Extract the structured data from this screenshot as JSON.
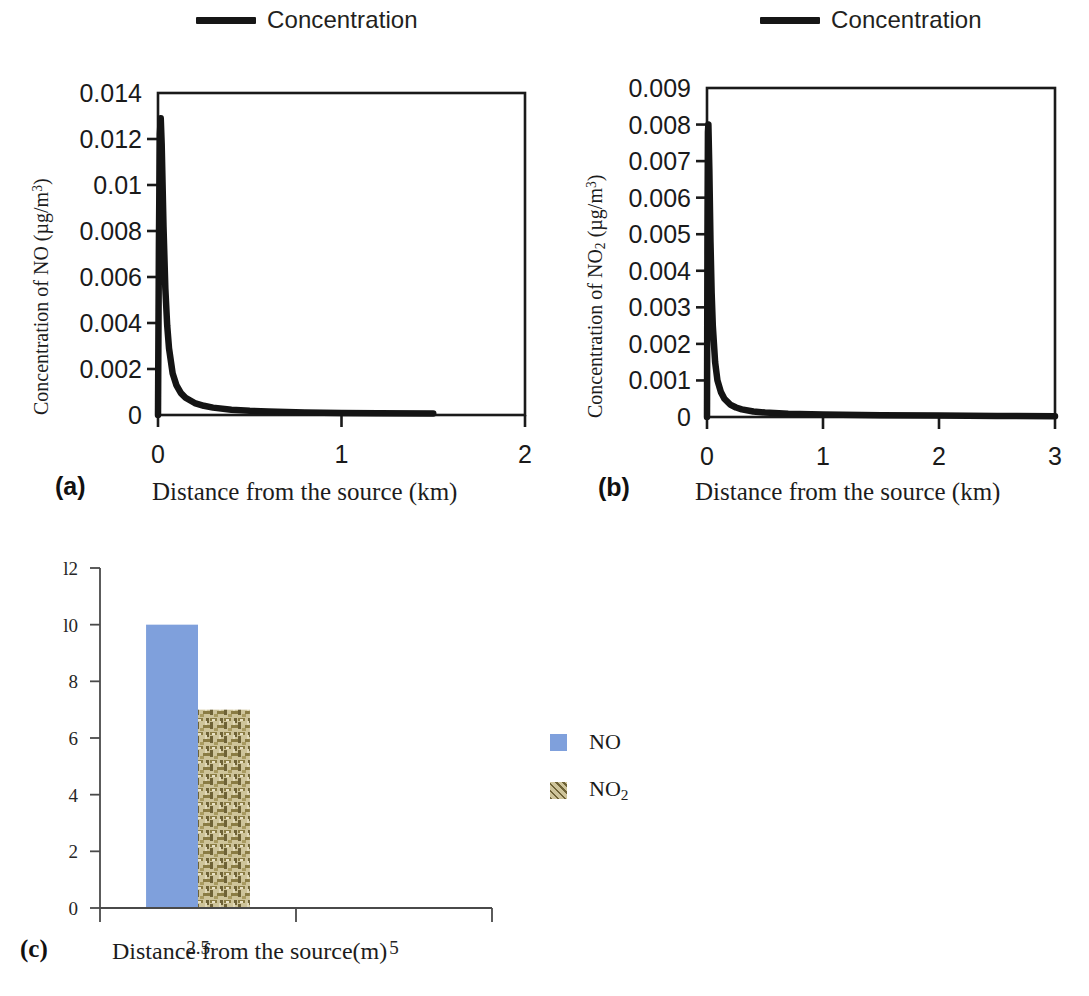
{
  "figure": {
    "panels": [
      {
        "id": "a",
        "letter": "(a)",
        "legend_label": "Concentration",
        "y_axis_label_html": "Concentration of NO (µg/m<sup>3</sup>)",
        "x_axis_label": "Distance from the source (km)",
        "y_ticks": [
          "0",
          "0.002",
          "0.004",
          "0.006",
          "0.008",
          "0.01",
          "0.012",
          "0.014"
        ],
        "x_ticks": [
          "0",
          "1",
          "2"
        ]
      },
      {
        "id": "b",
        "letter": "(b)",
        "legend_label": "Concentration",
        "y_axis_label_html": "Concentration of NO<sub>2</sub> (µg/m<sup>3</sup>)",
        "x_axis_label": "Distance from the source (km)",
        "y_ticks": [
          "0",
          "0.001",
          "0.002",
          "0.003",
          "0.004",
          "0.005",
          "0.006",
          "0.007",
          "0.008",
          "0.009"
        ],
        "x_ticks": [
          "0",
          "1",
          "2",
          "3"
        ]
      },
      {
        "id": "c",
        "letter": "(c)",
        "y_axis_label_html": "Concentration of  NOx (µg/m<sup>3</sup>)",
        "x_axis_label": "Distance from the source(m)",
        "y_ticks": [
          "0",
          "2",
          "4",
          "6",
          "8",
          "l0",
          "l2"
        ],
        "x_ticks": [
          "2.5",
          "5"
        ],
        "legend": [
          {
            "label_html": "NO",
            "color": "#7FA0DC"
          },
          {
            "label_html": "NO<sub>2</sub>",
            "color": "#C9BE8C"
          }
        ]
      }
    ]
  },
  "colors": {
    "curve": "#141414",
    "frame": "#1a1a1a",
    "no_bar": "#7FA0DC",
    "no2_bar_base": "#C9BE8C",
    "no2_bar_thread": "#7A6E3C",
    "axis_c": "#4a4a4a"
  },
  "chart_data": [
    {
      "type": "line",
      "panel": "a",
      "title": "",
      "xlabel": "Distance from the source (km)",
      "ylabel": "Concentration of NO (µg/m3)",
      "legend": [
        "Concentration"
      ],
      "legend_position": "top-center",
      "grid": false,
      "xlim": [
        0,
        2
      ],
      "ylim": [
        0,
        0.014
      ],
      "xticks": [
        0,
        1,
        2
      ],
      "yticks": [
        0,
        0.002,
        0.004,
        0.006,
        0.008,
        0.01,
        0.012,
        0.014
      ],
      "series": [
        {
          "name": "Concentration",
          "x": [
            0,
            0.005,
            0.01,
            0.015,
            0.02,
            0.03,
            0.04,
            0.05,
            0.06,
            0.08,
            0.1,
            0.125,
            0.15,
            0.2,
            0.25,
            0.3,
            0.4,
            0.5,
            0.6,
            0.8,
            1.0,
            1.2,
            1.5
          ],
          "y": [
            0,
            0.0075,
            0.0122,
            0.0129,
            0.0118,
            0.0082,
            0.0055,
            0.0039,
            0.0029,
            0.0018,
            0.0013,
            0.00095,
            0.00075,
            0.00052,
            0.0004,
            0.00032,
            0.00023,
            0.00018,
            0.00015,
            0.00011,
            9e-05,
            8e-05,
            7e-05
          ]
        }
      ]
    },
    {
      "type": "line",
      "panel": "b",
      "title": "",
      "xlabel": "Distance from the source (km)",
      "ylabel": "Concentration of NO2 (µg/m3)",
      "legend": [
        "Concentration"
      ],
      "legend_position": "top-center",
      "grid": false,
      "xlim": [
        0,
        3
      ],
      "ylim": [
        0,
        0.009
      ],
      "xticks": [
        0,
        1,
        2,
        3
      ],
      "yticks": [
        0,
        0.001,
        0.002,
        0.003,
        0.004,
        0.005,
        0.006,
        0.007,
        0.008,
        0.009
      ],
      "series": [
        {
          "name": "Concentration",
          "x": [
            0,
            0.004,
            0.008,
            0.012,
            0.02,
            0.03,
            0.04,
            0.05,
            0.07,
            0.09,
            0.12,
            0.15,
            0.2,
            0.25,
            0.3,
            0.4,
            0.5,
            0.7,
            1.0,
            1.5,
            2.0,
            2.5,
            3.0
          ],
          "y": [
            0,
            0.005,
            0.0078,
            0.008,
            0.0068,
            0.0048,
            0.0034,
            0.0025,
            0.0015,
            0.001,
            0.00068,
            0.0005,
            0.00034,
            0.00026,
            0.00021,
            0.00015,
            0.00012,
            9e-05,
            7e-05,
            5e-05,
            4e-05,
            3e-05,
            2e-05
          ]
        }
      ]
    },
    {
      "type": "bar",
      "panel": "c",
      "title": "",
      "xlabel": "Distance from the source(m)",
      "ylabel": "Concentration of  NOx (µg/m3)",
      "categories": [
        "2.5",
        "5"
      ],
      "legend_position": "right",
      "grid": false,
      "ylim": [
        0,
        12
      ],
      "yticks": [
        0,
        2,
        4,
        6,
        8,
        10,
        12
      ],
      "series": [
        {
          "name": "NO",
          "values": [
            10,
            0
          ],
          "color": "#7FA0DC"
        },
        {
          "name": "NO2",
          "values": [
            7,
            0
          ],
          "color": "#C9BE8C"
        }
      ]
    }
  ]
}
